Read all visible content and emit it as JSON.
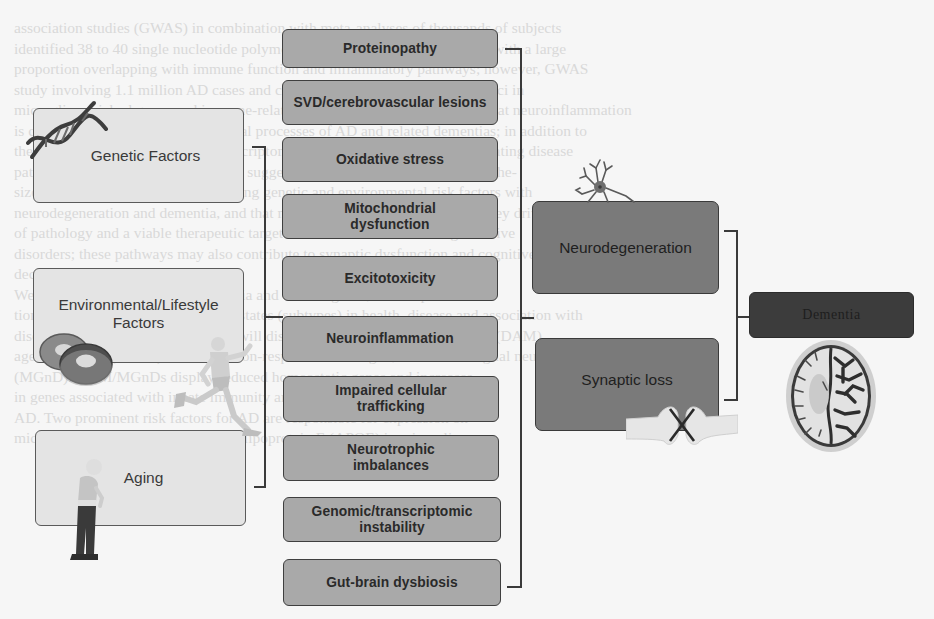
{
  "background_text": {
    "lines": [
      "association studies (GWAS) in combination with meta-analyses of thousands of subjects",
      "identified 38 to 40 single nucleotide polymorphisms associated with AD risk with a large",
      "proportion overlapping with immune function and inflammatory pathways; however, GWAS",
      "study involving 1.1 million AD cases and controls identified additional risk loci in",
      "microglia-enriched genes and immune-related pathways, further suggesting that neuroinflammation",
      "is closely associated with pathological processes of AD and related dementias; in addition to",
      "these data, support comes from transcriptomic and epigenomic studies implicating disease",
      "pathogenesis; together these findings suggest that neuroinflammation is hypothe-",
      "sized to be a central mechanism linking genetic and environmental risk factors with",
      "neurodegeneration and dementia, and that microglial activation represents a key driver",
      "of pathology and a viable therapeutic target in AD and related neurodegenerative",
      "disorders; these pathways may also contribute to synaptic dysfunction and cognitive",
      "decline.",
      "    We next focus on the role of microglia and discuss genes, transcrip-",
      "tional signatures (modules) and cell states (subtypes) in health, disease and association with",
      "disease and injury. In particular, we will discuss disease-associated microglia (DAM),",
      "aged microglia (ARMs), and interferon-responsive microglia, termed microglial neurodegenerative",
      "(MGnD). DAM/MGnDs display reduced homeostatic genes and increases",
      "in genes associated with innate immunity and genetic risk factors for",
      "AD. Two prominent risk factors for AD are responsible for expression on",
      "microglial surface (TREM2) and apolipoprotein E (APOE) in microglia."
    ]
  },
  "risk_factors": [
    {
      "label": "Genetic Factors",
      "icon": "dna-helix-icon"
    },
    {
      "label": "Environmental/Lifestyle Factors",
      "icon": "donuts-runner-icon"
    },
    {
      "label": "Aging",
      "icon": "elderly-person-icon"
    }
  ],
  "mechanisms": [
    {
      "label": "Proteinopathy"
    },
    {
      "label": "SVD/cerebrovascular lesions"
    },
    {
      "label": "Oxidative stress"
    },
    {
      "label": "Mitochondrial dysfunction"
    },
    {
      "label": "Excitotoxicity"
    },
    {
      "label": "Neuroinflammation"
    },
    {
      "label": "Impaired cellular trafficking"
    },
    {
      "label": "Neurotrophic imbalances"
    },
    {
      "label": "Genomic/transcriptomic instability"
    },
    {
      "label": "Gut-brain dysbiosis"
    }
  ],
  "outcomes": [
    {
      "label": "Neurodegeneration",
      "icon": "neuron-icon"
    },
    {
      "label": "Synaptic loss",
      "icon": "broken-synapse-icon"
    }
  ],
  "endpoint": {
    "label": "Dementia",
    "icon": "atrophied-brain-icon"
  },
  "colors": {
    "risk_factor_fill": "#e4e4e4",
    "mechanism_fill": "#a9a9a9",
    "outcome_fill": "#7a7a7a",
    "endpoint_fill": "#3c3c3c",
    "connector": "#3a3a3a"
  }
}
